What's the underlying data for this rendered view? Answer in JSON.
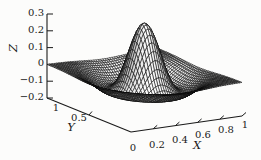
{
  "figure": {
    "kind": "scanned 3D surface mesh plot",
    "background": "#fcfcfb"
  },
  "chart_data": {
    "type": "3d-surface-mesh",
    "title": "",
    "xlabel": "X",
    "ylabel": "Y",
    "zlabel": "Z",
    "x_range": [
      0,
      1
    ],
    "y_range": [
      0,
      1
    ],
    "z_range": [
      -0.2,
      0.3
    ],
    "x_ticks": [
      {
        "value": 0,
        "label": "0",
        "mark": false,
        "label_pos": [
          133,
          147
        ]
      },
      {
        "value": 0.2,
        "label": "0.2",
        "mark": true,
        "label_pos": [
          157,
          144
        ]
      },
      {
        "value": 0.4,
        "label": "0.4",
        "mark": true,
        "label_pos": [
          180,
          139
        ]
      },
      {
        "value": 0.6,
        "label": "0.6",
        "mark": true,
        "label_pos": [
          203,
          134
        ]
      },
      {
        "value": 0.8,
        "label": "0.8",
        "mark": true,
        "label_pos": [
          226,
          129
        ]
      },
      {
        "value": 1,
        "label": "1",
        "mark": true,
        "label_pos": [
          245,
          124
        ]
      }
    ],
    "y_ticks": [
      {
        "value": 0.5,
        "label": "0.5",
        "mark": true,
        "label_pos": [
          79,
          117
        ]
      },
      {
        "value": 1,
        "label": "1",
        "mark": false,
        "label_pos": [
          56,
          107
        ]
      }
    ],
    "z_ticks": [
      {
        "value": 0.3,
        "label": "0.3",
        "mark": true
      },
      {
        "value": 0.2,
        "label": "0.2",
        "mark": true
      },
      {
        "value": 0.1,
        "label": "0.1",
        "mark": true
      },
      {
        "value": 0,
        "label": "0",
        "mark": true
      },
      {
        "value": -0.1,
        "label": "−0.1",
        "mark": true
      },
      {
        "value": -0.2,
        "label": "−0.2",
        "mark": true
      }
    ],
    "axis_letters": {
      "x": {
        "text": "X",
        "pos": [
          197,
          145
        ],
        "rotation": 0
      },
      "y": {
        "text": "Y",
        "pos": [
          71,
          127
        ],
        "rotation": 0
      },
      "z": {
        "text": "Z",
        "pos": [
          14,
          48
        ],
        "rotation": -90
      }
    },
    "surface": {
      "description": "Radially symmetric Mexican-hat (Ricker-like) bump centered at (0.5,0.5): z = A*(1 - r^2/r0^2)*exp(-c*r^2); peak z ~ 0.3, negative ring min z ~ -0.105 at r ~ 0.28, flattening to 0 at the domain edges",
      "center": [
        0.5,
        0.5
      ],
      "amplitude": 0.3,
      "zero_crossing_radius": 0.17,
      "decay": 20,
      "peak_z": 0.3,
      "ring_min_z": -0.105,
      "ring_min_radius": 0.28,
      "grid": 48
    },
    "view": {
      "projection": {
        "origin_px": [
          131,
          132
        ],
        "x_axis_px": [
          111,
          -16
        ],
        "y_axis_px": [
          -84,
          -34
        ],
        "z_scale_px": 168,
        "z_base": -0.2
      },
      "light_dir": [
        -0.25,
        -0.7,
        0.67
      ],
      "mesh_stroke": "#0a0a0a",
      "mesh_stroke_width": 0.55,
      "fill_min_gray": 118,
      "fill_gray_span": 137,
      "axis_color": "#1a1a1a",
      "grid_on": false,
      "legend": "none"
    }
  }
}
